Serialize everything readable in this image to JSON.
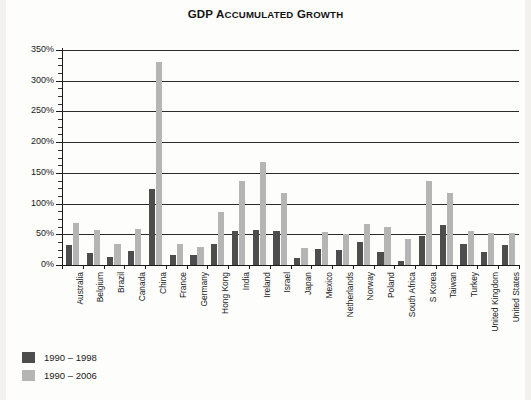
{
  "chart_data": {
    "type": "bar",
    "title": "GDP Accumulated Growth",
    "title_main": "GDP A",
    "xlabel": "",
    "ylabel": "",
    "ylim": [
      0,
      350
    ],
    "ytick_step": 50,
    "yminor_step": 12.5,
    "grid": true,
    "legend_position": "below-left",
    "ytick_labels": [
      "0%",
      "50%",
      "100%",
      "150%",
      "200%",
      "250%",
      "300%",
      "350%"
    ],
    "ytick_values": [
      0,
      50,
      100,
      150,
      200,
      250,
      300,
      350
    ],
    "categories": [
      "Australia",
      "Belgium",
      "Brazil",
      "Canada",
      "China",
      "France",
      "Germany",
      "Hong Kong",
      "India",
      "Ireland",
      "Israel",
      "Japan",
      "Mexico",
      "Netherlands",
      "Norway",
      "Poland",
      "South Africa",
      "S Korea",
      "Taiwan",
      "Turkey",
      "United Kingdom",
      "United States"
    ],
    "series": [
      {
        "name": "1990 – 1998",
        "color": "#4d4d4d",
        "values": [
          33,
          20,
          13,
          23,
          124,
          16,
          17,
          35,
          56,
          57,
          55,
          11,
          26,
          24,
          38,
          22,
          7,
          47,
          65,
          35,
          22,
          33
        ]
      },
      {
        "name": "1990 – 2006",
        "color": "#b5b5b5",
        "values": [
          68,
          57,
          34,
          59,
          331,
          35,
          29,
          87,
          137,
          167,
          117,
          27,
          53,
          50,
          66,
          62,
          43,
          137,
          118,
          55,
          52,
          52
        ]
      }
    ]
  },
  "legend": {
    "items": [
      {
        "label": "1990 – 1998",
        "color": "#4d4d4d"
      },
      {
        "label": "1990 – 2006",
        "color": "#b5b5b5"
      }
    ]
  },
  "colors": {
    "series_1990_1998": "#4d4d4d",
    "series_1990_2006": "#b5b5b5",
    "axis": "#1a1a1a",
    "gridline": "#2b2b2b",
    "background": "#fdfdfc"
  }
}
